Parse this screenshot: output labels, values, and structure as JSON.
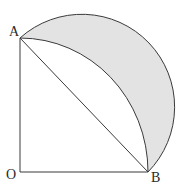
{
  "diagram": {
    "labels": {
      "A": "A",
      "B": "B",
      "O": "O"
    },
    "points": {
      "A": [
        20,
        38
      ],
      "O": [
        20,
        172
      ],
      "B": [
        148,
        172
      ]
    },
    "colors": {
      "stroke": "#3a3a3a",
      "shade": "#e3e3e3",
      "background": "#ffffff"
    }
  }
}
